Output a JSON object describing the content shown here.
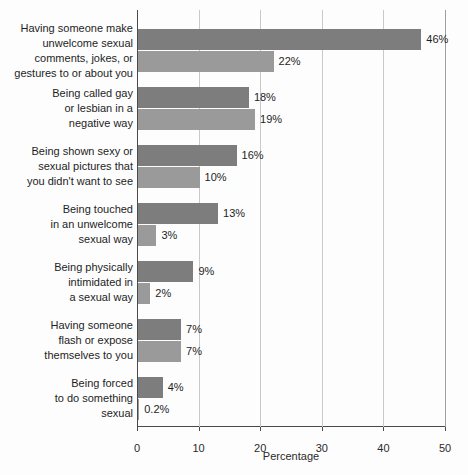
{
  "chart_data": {
    "type": "bar",
    "orientation": "horizontal",
    "title": "",
    "xlabel": "Percentage",
    "ylabel": "",
    "xlim": [
      0,
      50
    ],
    "xticks": [
      0,
      10,
      20,
      30,
      40,
      50
    ],
    "xtick_labels": [
      "0",
      "10",
      "20",
      "30",
      "40",
      "50"
    ],
    "grid": "vertical",
    "legend_position": "inside-right",
    "categories": [
      "Having someone make unwelcome sexual comments, jokes, or gestures to or about you",
      "Being called gay or lesbian in a negative way",
      "Being shown sexy or sexual pictures that you didn't want to see",
      "Being touched in an unwelcome sexual way",
      "Being physically intimidated in a sexual way",
      "Having someone flash or expose themselves to you",
      "Being forced to do something sexual"
    ],
    "category_lines": [
      [
        "Having someone make",
        "unwelcome sexual",
        "comments, jokes, or",
        "gestures to or about you"
      ],
      [
        "Being called gay",
        "or lesbian in a",
        "negative way"
      ],
      [
        "Being shown sexy or",
        "sexual pictures that",
        "you didn't want to see"
      ],
      [
        "Being touched",
        "in an unwelcome",
        "sexual way"
      ],
      [
        "Being physically",
        "intimidated in",
        "a sexual way"
      ],
      [
        "Having someone",
        "flash or expose",
        "themselves to you"
      ],
      [
        "Being forced",
        "to do something",
        "sexual"
      ]
    ],
    "series": [
      {
        "name": "Girls",
        "color": "#7d7d7d",
        "values": [
          46,
          18,
          16,
          13,
          9,
          7,
          4
        ],
        "labels": [
          "46%",
          "18%",
          "16%",
          "13%",
          "9%",
          "7%",
          "4%"
        ]
      },
      {
        "name": "Boys",
        "color": "#9a9a9a",
        "values": [
          22,
          19,
          10,
          3,
          2,
          7,
          0.2
        ],
        "labels": [
          "22%",
          "19%",
          "10%",
          "3%",
          "2%",
          "7%",
          "0.2%"
        ]
      }
    ]
  },
  "legend": {
    "items": [
      {
        "label": "Girls",
        "color": "#7d7d7d"
      },
      {
        "label": "Boys",
        "color": "#9a9a9a"
      }
    ]
  },
  "axis": {
    "x_title": "Percentage"
  }
}
